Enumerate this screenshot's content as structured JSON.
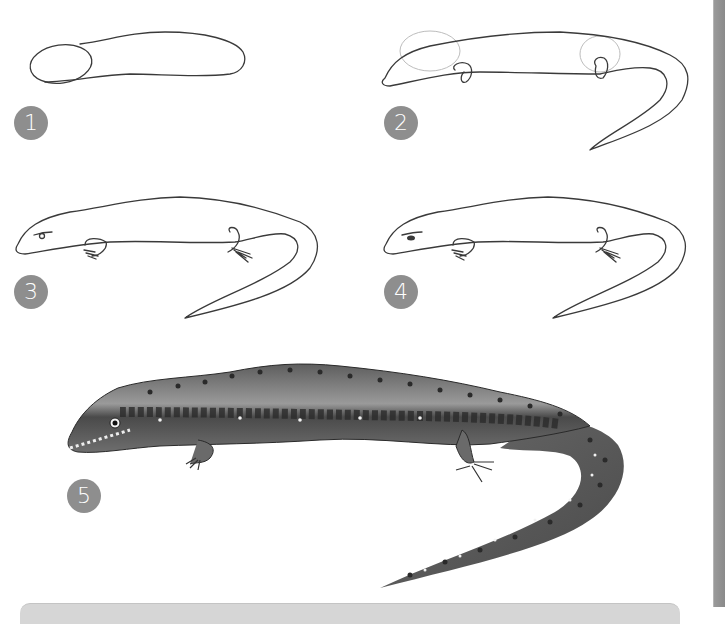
{
  "illustration": {
    "subject": "How to draw a lizard",
    "steps": [
      {
        "number": "1",
        "description": "Body oval with head oval"
      },
      {
        "number": "2",
        "description": "Add tail and leg joints"
      },
      {
        "number": "3",
        "description": "Outline head, eye and feet"
      },
      {
        "number": "4",
        "description": "Refine eye and toes"
      },
      {
        "number": "5",
        "description": "Finished shaded lizard with spots"
      }
    ]
  },
  "colors": {
    "badge": "#8e8e8e",
    "badge_text": "#ffffff",
    "sketch_line": "#3a3a3a",
    "guide_line": "#bdbdbd",
    "lizard_body": "#7a7a7a",
    "lizard_belly": "#a8a8a8",
    "lizard_spots": "#2a2a2a",
    "side_bar": "#8f8f8f",
    "bottom_panel": "#d6d6d6"
  }
}
